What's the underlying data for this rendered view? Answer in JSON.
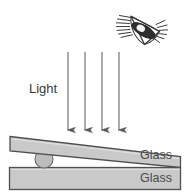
{
  "diagram": {
    "labels": {
      "light": "Light",
      "glass_top": "Glass",
      "glass_bottom": "Glass"
    },
    "observer": {
      "icon": "eye-icon",
      "description": "Eye with lashes viewing downward at the glass plates"
    },
    "light_rays": {
      "icon": "down-arrow-icon",
      "count": 4,
      "direction": "down",
      "x_positions": [
        68,
        85,
        102,
        119
      ],
      "y_start": 52,
      "y_end": 132
    },
    "plates": [
      {
        "name": "top-glass-plate",
        "label": "Glass",
        "tilted": true,
        "tilt_note": "raised on left by spacer ball, touching bottom plate at right"
      },
      {
        "name": "bottom-glass-plate",
        "label": "Glass",
        "tilted": false
      }
    ],
    "spacer": {
      "name": "spacer-ball",
      "shape": "circle",
      "cx": 44,
      "cy": 159,
      "r": 9
    },
    "colors": {
      "glass_fill": "#c9c9c9",
      "glass_stroke": "#5a5a5a",
      "ball_fill": "#bdbdbd",
      "arrow_stroke": "#5e5e5e",
      "eye_stroke": "#3b3b3b",
      "text": "#3c3c3c",
      "background": "#ffffff"
    }
  }
}
